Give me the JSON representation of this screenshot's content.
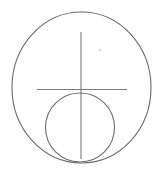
{
  "image": {
    "title": "Geometric line drawing",
    "description": "Large ellipse containing a smaller circle with crosshair lines",
    "width": 163,
    "height": 173,
    "background_color": "#ffffff",
    "stroke_color": "#6b6b6b",
    "speck_color": "#e2e2e2"
  },
  "shapes": {
    "outer_ellipse": {
      "name": "large ellipse",
      "center_x": 81.5,
      "center_y": 87.5,
      "radius_x": 69.5,
      "radius_y": 75.5,
      "stroke_color": "#6b6b6b",
      "stroke_width": 1.1,
      "fill": "none"
    },
    "inner_circle": {
      "name": "small circle",
      "center_x": 80,
      "center_y": 127.5,
      "radius": 34.5,
      "stroke_color": "#6b6b6b",
      "stroke_width": 1.1,
      "fill": "none"
    },
    "vertical_line": {
      "name": "vertical crosshair line",
      "x1": 81,
      "y1": 32,
      "x2": 81,
      "y2": 159,
      "stroke_color": "#7a7a7a",
      "stroke_width": 1.1
    },
    "horizontal_line": {
      "name": "horizontal crosshair line",
      "x1": 37,
      "y1": 89.5,
      "x2": 127,
      "y2": 89.5,
      "stroke_color": "#7a7a7a",
      "stroke_width": 1.1
    },
    "speck": {
      "name": "faint speck artifact",
      "center_x": 100,
      "center_y": 50,
      "radius": 1.6,
      "fill": "#e2e2e2"
    }
  }
}
